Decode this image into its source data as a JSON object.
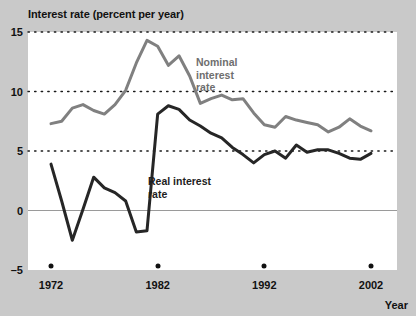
{
  "chart_data": {
    "type": "line",
    "title": "Interest rate (percent per year)",
    "xlabel": "Year",
    "ylabel": "Interest rate (percent per year)",
    "xlim": [
      1972,
      2002
    ],
    "ylim": [
      -5,
      15
    ],
    "yticks": [
      -5,
      0,
      5,
      10,
      15
    ],
    "ytick_labels": [
      "–5",
      "0",
      "5",
      "10",
      "15"
    ],
    "xticks": [
      1972,
      1982,
      1992,
      2002
    ],
    "xtick_labels": [
      "1972",
      "1982",
      "1992",
      "2002"
    ],
    "grid": "dotted horizontal gridlines at 5, 10, 15; solid zero line at 0",
    "legend_position": "inline annotations",
    "x": [
      1972,
      1973,
      1974,
      1975,
      1976,
      1977,
      1978,
      1979,
      1980,
      1981,
      1982,
      1983,
      1984,
      1985,
      1986,
      1987,
      1988,
      1989,
      1990,
      1991,
      1992,
      1993,
      1994,
      1995,
      1996,
      1997,
      1998,
      1999,
      2000,
      2001,
      2002
    ],
    "series": [
      {
        "name": "Nominal interest rate",
        "color": "#808080",
        "values": [
          7.3,
          7.5,
          8.6,
          8.9,
          8.4,
          8.1,
          8.9,
          10.1,
          12.4,
          14.3,
          13.8,
          12.2,
          13.0,
          11.3,
          9.0,
          9.4,
          9.7,
          9.3,
          9.4,
          8.2,
          7.2,
          7.0,
          7.9,
          7.6,
          7.4,
          7.2,
          6.6,
          7.0,
          7.7,
          7.1,
          6.7
        ]
      },
      {
        "name": "Real interest rate",
        "color": "#262626",
        "values": [
          3.9,
          0.8,
          -2.5,
          0.1,
          2.8,
          1.9,
          1.5,
          0.8,
          -1.8,
          -1.7,
          8.1,
          8.8,
          8.5,
          7.6,
          7.1,
          6.5,
          6.1,
          5.3,
          4.7,
          4.0,
          4.7,
          5.0,
          4.4,
          5.5,
          4.9,
          5.1,
          5.1,
          4.8,
          4.4,
          4.3,
          4.8
        ]
      }
    ],
    "annotations": [
      {
        "name": "nominal-label",
        "text": "Nominal\ninterest\nrate",
        "color": "#6e6e6e"
      },
      {
        "name": "real-label",
        "text": "Real interest\nrate",
        "color": "#1d1d1d"
      }
    ]
  },
  "colors": {
    "background": "#c9c9c9",
    "plot_background": "#ffffff",
    "nominal": "#808080",
    "real": "#262626",
    "grid": "#1a1a1a",
    "zero_line": "#9a9a9a",
    "text": "#111111"
  }
}
